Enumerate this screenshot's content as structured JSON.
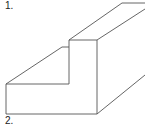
{
  "labels": {
    "first": "1.",
    "second": "2."
  },
  "figure": {
    "type": "isometric-step-block",
    "stroke_color": "#555555",
    "background": "#ffffff"
  }
}
